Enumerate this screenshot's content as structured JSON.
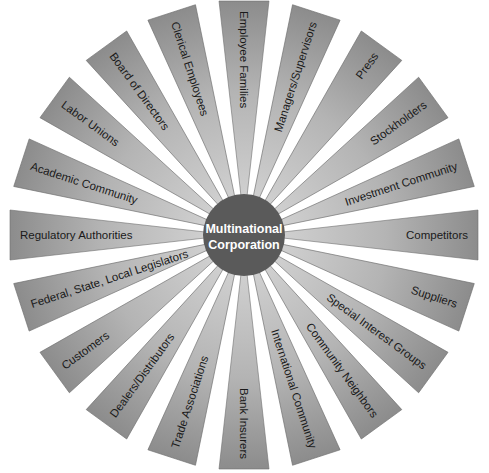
{
  "diagram": {
    "center": {
      "line1": "Multinational",
      "line2": "Corporation",
      "fill": "#5a5a5a",
      "cx": 244,
      "cy": 235,
      "r": 41
    },
    "ray_style": {
      "fill_dark": "#8c8c8c",
      "fill_light": "#d2d2d2",
      "stroke": "#6e6e6e",
      "outer_radius": 234,
      "inner_radius": 30,
      "tip_half_width": 25
    },
    "stakeholders": [
      {
        "label": "Employee Families",
        "angle": -90
      },
      {
        "label": "Managers/Supervisors",
        "angle": -72
      },
      {
        "label": "Press",
        "angle": -54
      },
      {
        "label": "Stockholders",
        "angle": -36
      },
      {
        "label": "Investment Community",
        "angle": -18
      },
      {
        "label": "Competitors",
        "angle": 0
      },
      {
        "label": "Suppliers",
        "angle": 18
      },
      {
        "label": "Special Interest Groups",
        "angle": 36
      },
      {
        "label": "Community Neighbors",
        "angle": 54
      },
      {
        "label": "International Community",
        "angle": 72
      },
      {
        "label": "Bank Insurers",
        "angle": 90
      },
      {
        "label": "Trade Associations",
        "angle": 108
      },
      {
        "label": "Dealers/Distributors",
        "angle": 126
      },
      {
        "label": "Customers",
        "angle": 144
      },
      {
        "label": "Federal, State, Local Legislators",
        "angle": 162
      },
      {
        "label": "Regulatory Authorities",
        "angle": 180
      },
      {
        "label": "Academic Community",
        "angle": 198
      },
      {
        "label": "Labor Unions",
        "angle": 216
      },
      {
        "label": "Board of Directors",
        "angle": 234
      },
      {
        "label": "Clerical Employees",
        "angle": 252
      }
    ]
  }
}
